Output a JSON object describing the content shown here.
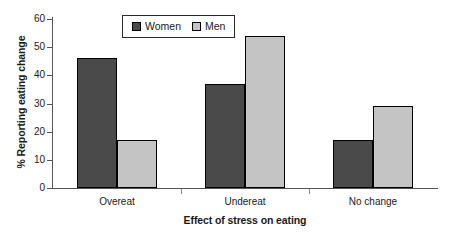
{
  "chart_data": {
    "type": "bar",
    "title": "",
    "xlabel": "Effect of stress on eating",
    "ylabel": "% Reporting eating change",
    "categories": [
      "Overeat",
      "Undereat",
      "No change"
    ],
    "series": [
      {
        "name": "Women",
        "color": "#4a4a4a",
        "values": [
          46,
          37,
          17
        ]
      },
      {
        "name": "Men",
        "color": "#c4c4c4",
        "values": [
          17,
          54,
          29
        ]
      }
    ],
    "ylim": [
      0,
      60
    ],
    "yticks": [
      0,
      10,
      20,
      30,
      40,
      50,
      60
    ],
    "ytick_labels": [
      "0",
      "10",
      "20",
      "30",
      "40",
      "50",
      "60"
    ],
    "grid": false,
    "legend_position": "top-left-inside"
  },
  "legend": {
    "items": [
      {
        "label": "Women",
        "swatch": "women-swatch"
      },
      {
        "label": "Men",
        "swatch": "men-swatch"
      }
    ]
  },
  "axes": {
    "y_title": "% Reporting eating change",
    "x_title": "Effect of stress on eating",
    "y_labels": [
      "60",
      "50",
      "40",
      "30",
      "20",
      "10",
      "0"
    ],
    "x_labels": [
      "Overeat",
      "Undereat",
      "No change"
    ]
  }
}
